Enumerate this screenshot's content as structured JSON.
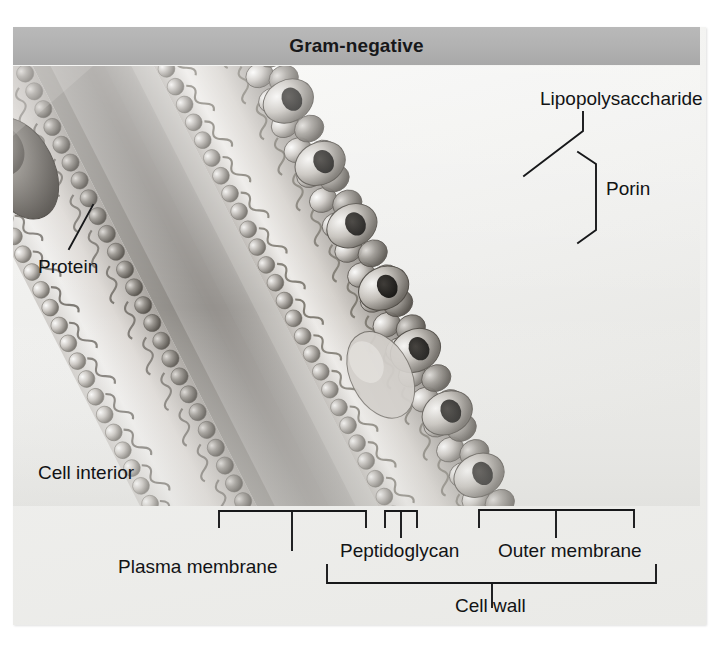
{
  "figure": {
    "title": "Gram-negative",
    "title_bg": "#b2b2b2",
    "panel_bg": "#f1f1ef",
    "line_color": "#17181a"
  },
  "labels": {
    "lipopolysaccharide": "Lipopolysaccharide",
    "porin": "Porin",
    "protein": "Protein",
    "cell_interior": "Cell interior",
    "plasma_membrane": "Plasma membrane",
    "peptidoglycan": "Peptidoglycan",
    "outer_membrane": "Outer membrane",
    "cell_wall": "Cell wall"
  },
  "structures": {
    "plasma_membrane": "phospholipid bilayer with embedded integral membrane proteins",
    "periplasm": "gap between plasma membrane and outer membrane",
    "peptidoglycan": "thin peptidoglycan layer within the periplasmic space",
    "outer_membrane": "asymmetric bilayer bearing lipopolysaccharide and porin channels"
  },
  "icons": {
    "protein_blob": "membrane-protein-icon",
    "porin_channel": "porin-channel-icon",
    "lps_head": "lipopolysaccharide-icon",
    "lipid_head": "phospholipid-head-icon",
    "lipid_tail": "phospholipid-tail-icon"
  }
}
